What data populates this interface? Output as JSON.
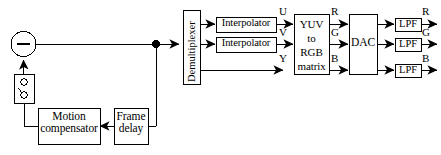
{
  "diagram": {
    "colors": {
      "stroke": "#000000",
      "fill": "#ffffff",
      "background": "#ffffff"
    },
    "blocks": {
      "summer": {
        "label": "−",
        "shape": "circle"
      },
      "switch": {
        "label": "switch-symbol",
        "shape": "rect"
      },
      "motion_compensator": {
        "label": "Motion\ncompensator"
      },
      "frame_delay": {
        "label": "Frame\ndelay"
      },
      "demultiplexer": {
        "label": "Demultiplexer"
      },
      "interpolator_u": {
        "label": "Interpolator"
      },
      "interpolator_v": {
        "label": "Interpolator"
      },
      "yuv_matrix": {
        "label": "YUV\nto\nRGB\nmatrix"
      },
      "dac": {
        "label": "DAC"
      },
      "lpf_r": {
        "label": "LPF"
      },
      "lpf_g": {
        "label": "LPF"
      },
      "lpf_b": {
        "label": "LPF"
      }
    },
    "signal_labels": {
      "u": "U",
      "v": "V",
      "y": "Y",
      "matrix_out_r": "R",
      "matrix_out_g": "G",
      "matrix_out_b": "B",
      "out_r": "R",
      "out_g": "G",
      "out_b": "B"
    }
  }
}
